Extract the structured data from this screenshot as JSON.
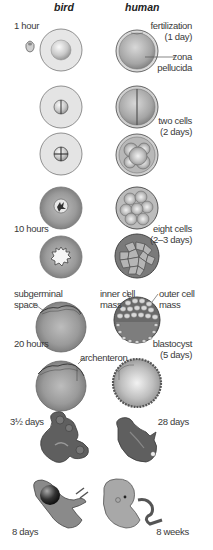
{
  "header": {
    "col_bird": "bird",
    "col_human": "human"
  },
  "stages": [
    {
      "bird_label": "1 hour",
      "human_label_line1": "fertilization",
      "human_label_line2": "(1 day)",
      "human_annotation_line1": "zona",
      "human_annotation_line2": "pellucida"
    },
    {
      "human_label_line1": "two cells",
      "human_label_line2": "(2 days)"
    },
    {},
    {
      "bird_label": "10 hours",
      "human_label_line1": "eight cells",
      "human_label_line2": "(2–3 days)"
    },
    {},
    {
      "bird_annotation_line1": "subgerminal",
      "bird_annotation_line2": "space",
      "bird_label": "20 hours",
      "human_annotation_left_line1": "inner cell",
      "human_annotation_left_line2": "mass",
      "human_annotation_right_line1": "outer cell",
      "human_annotation_right_line2": "mass",
      "human_label_line1": "blastocyst",
      "human_label_line2": "(5 days)"
    },
    {
      "bird_annotation": "archenteron"
    },
    {
      "bird_label": "3½ days",
      "human_label": "28 days"
    },
    {
      "bird_label": "8 days",
      "human_label": "8 weeks"
    }
  ],
  "colors": {
    "background": "#ffffff",
    "cell_light": "#e4e4e4",
    "cell_mid": "#b8b8b8",
    "cell_dark": "#6f6f6f",
    "outline": "#555555",
    "embryo_dark": "#5e5e5e"
  }
}
